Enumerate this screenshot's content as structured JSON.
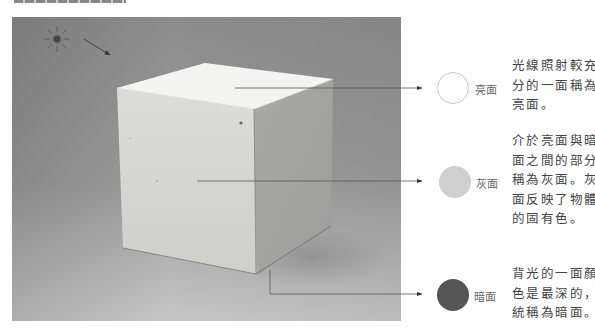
{
  "figure": {
    "light_source_icon": "sun-icon"
  },
  "legend": [
    {
      "id": "light",
      "label": "亮面",
      "swatch_color": "#ffffff",
      "description_lines": [
        "光線照射較充",
        "分的一面稱為",
        "亮面。"
      ]
    },
    {
      "id": "gray",
      "label": "灰面",
      "swatch_color": "#cfcfcf",
      "description_lines": [
        "介於亮面與暗",
        "面之間的部分",
        "稱為灰面。灰",
        "面反映了物體",
        "的固有色。"
      ]
    },
    {
      "id": "dark",
      "label": "暗面",
      "swatch_color": "#555555",
      "description_lines": [
        "背光的一面顏",
        "色是最深的，",
        "統稱為暗面。"
      ]
    }
  ],
  "colors": {
    "background_top": "#8a8a8a",
    "background_bottom": "#c4c4c4",
    "cube_top": "#f4f4f2",
    "cube_front": "#d6d6d2",
    "cube_right": "#a8a8a6",
    "arrow": "#444444"
  }
}
